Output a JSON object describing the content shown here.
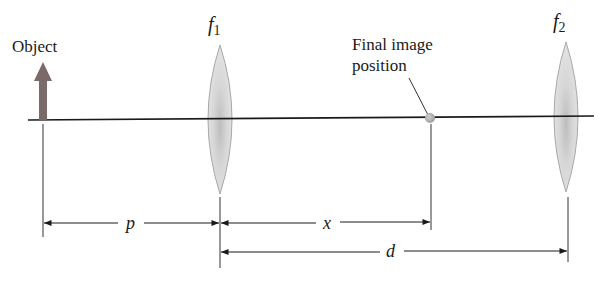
{
  "labels": {
    "object": "Object",
    "lens1": "f",
    "lens1_sub": "1",
    "lens2": "f",
    "lens2_sub": "2",
    "final_image_line1": "Final image",
    "final_image_line2": "position",
    "dim_p": "p",
    "dim_x": "x",
    "dim_d": "d"
  },
  "colors": {
    "axis": "#1a1a1a",
    "object_arrow": "#7a6a6a",
    "lens_fill": "#d4d4d4",
    "lens_edge": "#a8a8a8",
    "image_dot": "#b8b8b8"
  }
}
